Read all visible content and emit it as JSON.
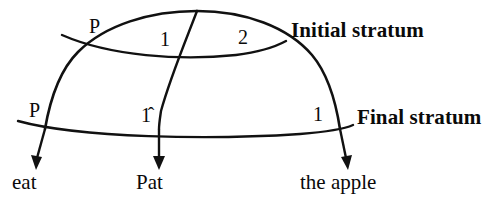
{
  "diagram": {
    "type": "relational-grammar-stratal-diagram",
    "sentence": "Pat eat the apple",
    "strata": [
      {
        "id": "initial",
        "label": "Initial stratum"
      },
      {
        "id": "final",
        "label": "Final stratum"
      }
    ],
    "relation_labels": {
      "initial_predicate": "P",
      "initial_subject": "1",
      "initial_object": "2",
      "final_predicate": "P",
      "final_subject": "1̂",
      "final_object": "1"
    },
    "terminal_nodes": [
      {
        "id": "predicate",
        "word": "eat"
      },
      {
        "id": "subject",
        "word": "Pat"
      },
      {
        "id": "object",
        "word": "the apple"
      }
    ],
    "ink_color": "#111111",
    "background_color": "#ffffff"
  }
}
